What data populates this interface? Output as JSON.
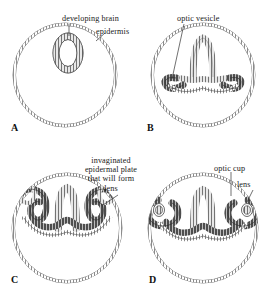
{
  "figure": {
    "background_color": "#ffffff",
    "ink_color": "#3a3a3a",
    "dark_tissue_color": "#4a4a4a"
  },
  "panels": [
    {
      "letter": "A",
      "caption": "Early neural tube stage",
      "labels": [
        {
          "name": "developing-brain",
          "text": "developing brain"
        },
        {
          "name": "epidermis",
          "text": "epidermis"
        }
      ]
    },
    {
      "letter": "B",
      "caption": "Optic vesicle evagination",
      "labels": [
        {
          "name": "optic-vesicle",
          "text": "optic vesicle"
        }
      ]
    },
    {
      "letter": "C",
      "caption": "Lens placode invagination",
      "labels": [
        {
          "name": "invaginated-epidermal-plate",
          "lines": [
            "invaginated",
            "epidermal plate",
            "that will form",
            "lens"
          ]
        }
      ]
    },
    {
      "letter": "D",
      "caption": "Optic cup and lens vesicle",
      "labels": [
        {
          "name": "optic-cup",
          "text": "optic cup"
        },
        {
          "name": "lens",
          "text": "lens"
        }
      ]
    }
  ],
  "label_text": {
    "developing_brain": "developing brain",
    "epidermis": "epidermis",
    "optic_vesicle": "optic vesicle",
    "invaginated_line1": "invaginated",
    "invaginated_line2": "epidermal plate",
    "invaginated_line3": "that will form",
    "invaginated_line4": "lens",
    "optic_cup": "optic cup",
    "lens": "lens",
    "letter_a": "A",
    "letter_b": "B",
    "letter_c": "C",
    "letter_d": "D"
  }
}
